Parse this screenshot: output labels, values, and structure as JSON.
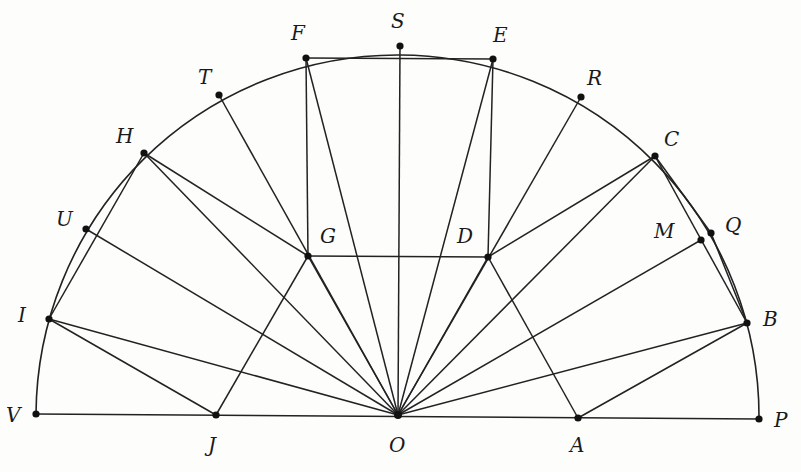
{
  "diagram": {
    "type": "semicircle-geometry-construction",
    "center": "O",
    "colors": {
      "line": "#222222",
      "point": "#111111",
      "label": "#1a1a1a",
      "background": "#fdfdfc"
    },
    "points": [
      {
        "id": "V",
        "x": 36,
        "y": 414,
        "lx": 6,
        "ly": 422
      },
      {
        "id": "J",
        "x": 216,
        "y": 415,
        "lx": 208,
        "ly": 452
      },
      {
        "id": "O",
        "x": 398,
        "y": 415,
        "lx": 389,
        "ly": 452
      },
      {
        "id": "A",
        "x": 578,
        "y": 418,
        "lx": 570,
        "ly": 452
      },
      {
        "id": "P",
        "x": 759,
        "y": 419,
        "lx": 774,
        "ly": 427
      },
      {
        "id": "I",
        "x": 49,
        "y": 319,
        "lx": 18,
        "ly": 322
      },
      {
        "id": "U",
        "x": 86,
        "y": 229,
        "lx": 56,
        "ly": 226
      },
      {
        "id": "H",
        "x": 144,
        "y": 153,
        "lx": 116,
        "ly": 143
      },
      {
        "id": "T",
        "x": 219,
        "y": 95,
        "lx": 198,
        "ly": 84
      },
      {
        "id": "F",
        "x": 306,
        "y": 58,
        "lx": 291,
        "ly": 40
      },
      {
        "id": "S",
        "x": 400,
        "y": 46,
        "lx": 391,
        "ly": 28
      },
      {
        "id": "E",
        "x": 493,
        "y": 59,
        "lx": 493,
        "ly": 42
      },
      {
        "id": "R",
        "x": 581,
        "y": 97,
        "lx": 587,
        "ly": 85
      },
      {
        "id": "C",
        "x": 655,
        "y": 156,
        "lx": 664,
        "ly": 146
      },
      {
        "id": "M",
        "x": 701,
        "y": 240,
        "lx": 654,
        "ly": 238
      },
      {
        "id": "Q",
        "x": 711,
        "y": 233,
        "lx": 725,
        "ly": 232
      },
      {
        "id": "B",
        "x": 747,
        "y": 323,
        "lx": 763,
        "ly": 326
      },
      {
        "id": "G",
        "x": 308,
        "y": 256,
        "lx": 320,
        "ly": 243
      },
      {
        "id": "D",
        "x": 488,
        "y": 257,
        "lx": 457,
        "ly": 243
      }
    ],
    "segments": [
      [
        "V",
        "P"
      ],
      [
        "O",
        "I"
      ],
      [
        "O",
        "U"
      ],
      [
        "O",
        "H"
      ],
      [
        "O",
        "T"
      ],
      [
        "O",
        "F"
      ],
      [
        "O",
        "S"
      ],
      [
        "O",
        "E"
      ],
      [
        "O",
        "R"
      ],
      [
        "O",
        "C"
      ],
      [
        "O",
        "M"
      ],
      [
        "O",
        "B"
      ],
      [
        "O",
        "G"
      ],
      [
        "O",
        "D"
      ],
      [
        "H",
        "I"
      ],
      [
        "I",
        "J"
      ],
      [
        "J",
        "G"
      ],
      [
        "G",
        "H"
      ],
      [
        "F",
        "E"
      ],
      [
        "F",
        "G"
      ],
      [
        "E",
        "D"
      ],
      [
        "G",
        "D"
      ],
      [
        "C",
        "D"
      ],
      [
        "C",
        "B"
      ],
      [
        "D",
        "A"
      ],
      [
        "A",
        "B"
      ],
      [
        "C",
        "Q"
      ],
      [
        "Q",
        "B"
      ]
    ],
    "arc": {
      "from": "V",
      "to": "P",
      "cx": 398,
      "cy": 416,
      "r": 361
    },
    "labels": [
      "V",
      "J",
      "O",
      "A",
      "P",
      "I",
      "U",
      "H",
      "T",
      "F",
      "S",
      "E",
      "R",
      "C",
      "M",
      "Q",
      "B",
      "G",
      "D"
    ]
  }
}
